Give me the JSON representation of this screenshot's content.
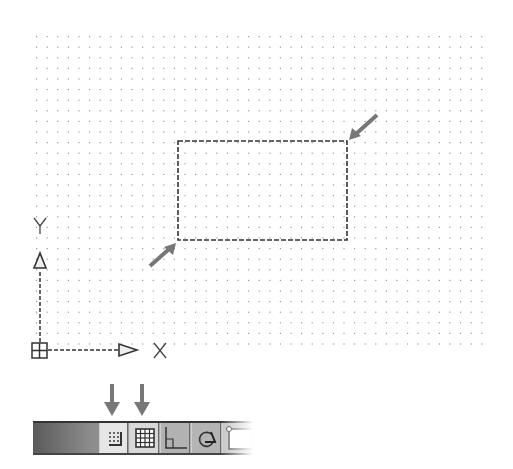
{
  "canvas": {
    "grid": {
      "x0": 36,
      "y0": 36,
      "x1": 487,
      "y1": 347,
      "spacing": 10.6,
      "dot_color": "#9a9a9a"
    },
    "rectangle": {
      "x": 178,
      "y": 141,
      "width": 169,
      "height": 99,
      "line_style": "dashed",
      "color": "#333333"
    },
    "callout_arrows": [
      {
        "name": "corner-top-right",
        "from": [
          377,
          115
        ],
        "to": [
          352,
          137
        ]
      },
      {
        "name": "corner-bottom-left",
        "from": [
          150,
          266
        ],
        "to": [
          173,
          246
        ]
      }
    ],
    "ucs_icon": {
      "origin": [
        40,
        350
      ],
      "x_axis_label": "X",
      "y_axis_label": "Y"
    }
  },
  "status_bar": {
    "buttons": [
      {
        "id": "snap",
        "icon": "snap-mode-icon",
        "state": "on"
      },
      {
        "id": "grid",
        "icon": "grid-display-icon",
        "state": "on"
      },
      {
        "id": "ortho",
        "icon": "ortho-mode-icon",
        "state": "off"
      },
      {
        "id": "polar",
        "icon": "polar-tracking-icon",
        "state": "off"
      },
      {
        "id": "osnap",
        "icon": "object-snap-icon",
        "state": "off"
      }
    ],
    "callout_arrows": [
      "snap",
      "grid"
    ],
    "accent_color": "#777777"
  }
}
